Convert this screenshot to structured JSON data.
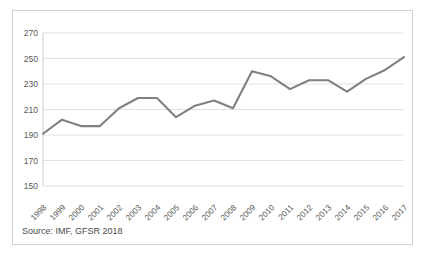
{
  "chart_data": {
    "type": "line",
    "title": "",
    "subtitle": "",
    "xlabel": "",
    "ylabel": "",
    "categories": [
      "1998",
      "1999",
      "2000",
      "2001",
      "2002",
      "2003",
      "2004",
      "2005",
      "2006",
      "2007",
      "2008",
      "2009",
      "2010",
      "2011",
      "2012",
      "2013",
      "2014",
      "2015",
      "2016",
      "2017"
    ],
    "series": [
      {
        "name": "",
        "values": [
          191,
          202,
          197,
          197,
          211,
          219,
          219,
          204,
          213,
          217,
          211,
          240,
          236,
          226,
          233,
          233,
          224,
          234,
          241,
          251
        ]
      }
    ],
    "ylim": [
      150,
      270
    ],
    "yticks": [
      150,
      170,
      190,
      210,
      230,
      250,
      270
    ],
    "ytick_labels": [
      "150",
      "170",
      "190",
      "210",
      "230",
      "250",
      "270"
    ],
    "xtick_labels": [
      "1998",
      "1999",
      "2000",
      "2001",
      "2002",
      "2003",
      "2004",
      "2005",
      "2006",
      "2007",
      "2008",
      "2009",
      "2010",
      "2011",
      "2012",
      "2013",
      "2014",
      "2015",
      "2016",
      "2017"
    ],
    "grid": true,
    "grid_axis": "y",
    "legend": false,
    "legend_position": "none",
    "line_color": "#808080",
    "grid_color": "#d9d9d9",
    "text_color": "#595959",
    "background_color": "#ffffff",
    "border_color": "#d0d0d0",
    "annotations": []
  },
  "footer": {
    "source_text": "Source: IMF, GFSR 2018"
  }
}
